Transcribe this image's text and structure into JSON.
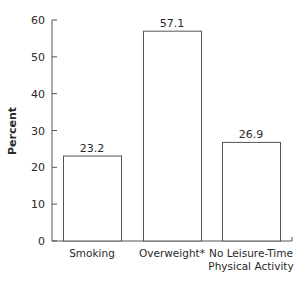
{
  "chart_data": {
    "type": "bar",
    "title": "",
    "xlabel": "",
    "ylabel": "Percent",
    "ylim": [
      0,
      60
    ],
    "yticks": [
      0,
      10,
      20,
      30,
      40,
      50,
      60
    ],
    "grid": false,
    "legend": "none",
    "categories": [
      [
        "Smoking"
      ],
      [
        "Overweight*"
      ],
      [
        "No Leisure-Time",
        "Physical Activity"
      ]
    ],
    "values": [
      23.2,
      57.1,
      26.9
    ],
    "data_labels": [
      "23.2",
      "57.1",
      "26.9"
    ],
    "colors": {
      "bar_fill": "#ffffff",
      "bar_stroke": "#555555",
      "axis": "#555555",
      "text": "#2a2a2a"
    }
  }
}
